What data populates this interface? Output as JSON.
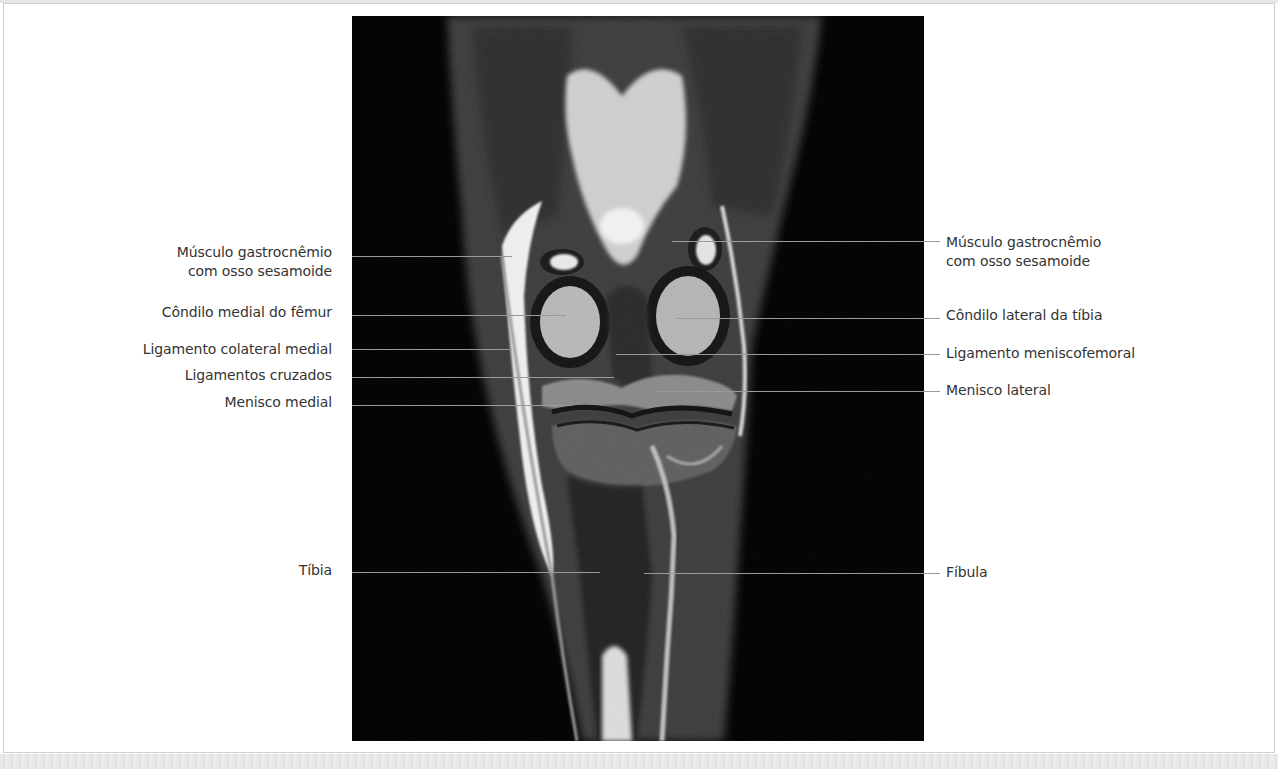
{
  "figure": {
    "image_alt": "Coronal MRI of the knee",
    "labels_left": [
      {
        "id": "gastro-medial",
        "lines": [
          "Músculo gastrocnêmio",
          "com osso sesamoide"
        ]
      },
      {
        "id": "condilo-medial-femur",
        "lines": [
          "Côndilo medial do fêmur"
        ]
      },
      {
        "id": "lig-colateral-medial",
        "lines": [
          "Ligamento colateral medial"
        ]
      },
      {
        "id": "lig-cruzados",
        "lines": [
          "Ligamentos cruzados"
        ]
      },
      {
        "id": "menisco-medial",
        "lines": [
          "Menisco medial"
        ]
      },
      {
        "id": "tibia",
        "lines": [
          "Tíbia"
        ]
      }
    ],
    "labels_right": [
      {
        "id": "gastro-lateral",
        "lines": [
          "Músculo gastrocnêmio",
          "com osso sesamoide"
        ]
      },
      {
        "id": "condilo-lateral-tibia",
        "lines": [
          "Côndilo lateral da tíbia"
        ]
      },
      {
        "id": "lig-meniscofemoral",
        "lines": [
          "Ligamento meniscofemoral"
        ]
      },
      {
        "id": "menisco-lateral",
        "lines": [
          "Menisco lateral"
        ]
      },
      {
        "id": "fibula",
        "lines": [
          "Fíbula"
        ]
      }
    ]
  }
}
